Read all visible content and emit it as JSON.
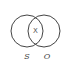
{
  "diagram": {
    "type": "venn",
    "sets": [
      {
        "label": "S"
      },
      {
        "label": "O"
      }
    ],
    "intersection_label": "X",
    "colors": {
      "stroke": "#444444",
      "background": "#ffffff"
    }
  }
}
